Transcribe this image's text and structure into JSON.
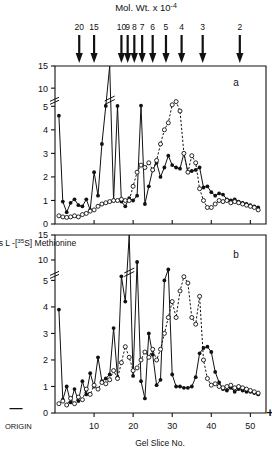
{
  "figure": {
    "top_title": "Mol. Wt. x 10-4",
    "x_axis_label": "Gel Slice No.",
    "y_axis_label": "% Total counts  L -[35S] Methionine",
    "origin_label": "ORIGIN",
    "negative_sign": "—",
    "positive_sign": "+",
    "panel_a_label": "a",
    "panel_b_label": "b"
  },
  "chart_data": [
    {
      "type": "line",
      "panel": "a",
      "title": "Mol. Wt. x 10-4",
      "xlabel": "Gel Slice No.",
      "ylabel": "% Total counts  L -[35S] Methionine",
      "xlim": [
        0,
        54
      ],
      "ylim": [
        0,
        15
      ],
      "y_axis_break": [
        5,
        10
      ],
      "xticks": [
        10,
        20,
        30,
        40,
        50
      ],
      "yticks": [
        0,
        1,
        2,
        3,
        4,
        5,
        10,
        15
      ],
      "grid": false,
      "legend": "none",
      "marker_axis": {
        "name": "Mol. Wt. x 10-4",
        "labels": [
          "20",
          "15",
          "10",
          "9",
          "8",
          "7",
          "6",
          "5",
          "4",
          "3",
          "2"
        ],
        "slice_positions": [
          6.2,
          10.0,
          17.0,
          18.6,
          20.3,
          22.3,
          25.0,
          28.4,
          32.4,
          37.8,
          47.3
        ]
      },
      "series": [
        {
          "name": "solid-filled-circles",
          "marker": "filled-circle",
          "line": "solid",
          "x": [
            1,
            2,
            3,
            4,
            5,
            6,
            7,
            8,
            9,
            10,
            11,
            12,
            13,
            14,
            15,
            16,
            17,
            18,
            19,
            20,
            21,
            22,
            23,
            24,
            25,
            26,
            27,
            28,
            29,
            30,
            31,
            32,
            33,
            34,
            35,
            36,
            37,
            38,
            39,
            40,
            41,
            42,
            43,
            44,
            45,
            46,
            47,
            48,
            49,
            50,
            51,
            52
          ],
          "y": [
            4.6,
            0.95,
            0.5,
            0.9,
            1.05,
            0.8,
            0.75,
            1.05,
            0.6,
            2.2,
            1.2,
            3.4,
            5.1,
            15.0,
            1.0,
            5.1,
            0.95,
            0.75,
            1.1,
            1.0,
            1.2,
            5.2,
            0.85,
            1.6,
            2.3,
            2.6,
            2.0,
            2.4,
            2.9,
            2.5,
            2.4,
            2.35,
            3.0,
            2.2,
            2.25,
            2.3,
            2.4,
            1.55,
            1.6,
            1.35,
            1.2,
            1.3,
            1.25,
            1.05,
            1.0,
            1.05,
            0.95,
            0.9,
            0.85,
            0.8,
            0.75,
            0.7
          ]
        },
        {
          "name": "dashed-open-circles",
          "marker": "open-circle",
          "line": "dashed",
          "x": [
            1,
            2,
            3,
            4,
            5,
            6,
            7,
            8,
            9,
            10,
            11,
            12,
            13,
            14,
            15,
            16,
            17,
            18,
            19,
            20,
            21,
            22,
            23,
            24,
            25,
            26,
            27,
            28,
            29,
            30,
            31,
            32,
            33,
            34,
            35,
            36,
            37,
            38,
            39,
            40,
            41,
            42,
            43,
            44,
            45,
            46,
            47,
            48,
            49,
            50,
            51,
            52
          ],
          "y": [
            0.35,
            0.3,
            0.28,
            0.3,
            0.35,
            0.3,
            0.4,
            0.45,
            0.55,
            0.6,
            0.75,
            0.85,
            0.9,
            0.95,
            1.0,
            1.0,
            1.05,
            1.0,
            1.0,
            1.6,
            2.2,
            2.5,
            2.4,
            2.6,
            2.3,
            2.7,
            3.4,
            4.0,
            4.3,
            5.4,
            6.3,
            4.8,
            3.0,
            2.2,
            2.9,
            2.6,
            1.5,
            1.0,
            0.7,
            0.7,
            0.85,
            1.0,
            0.95,
            1.0,
            0.9,
            0.95,
            0.9,
            0.85,
            0.8,
            0.75,
            0.7,
            0.6
          ]
        }
      ]
    },
    {
      "type": "line",
      "panel": "b",
      "xlabel": "Gel Slice No.",
      "ylabel": "% Total counts  L -[35S] Methionine",
      "xlim": [
        0,
        54
      ],
      "ylim": [
        0,
        15
      ],
      "y_axis_break": [
        5,
        10
      ],
      "xticks": [
        10,
        20,
        30,
        40,
        50
      ],
      "yticks": [
        0,
        1,
        2,
        3,
        4,
        5,
        10,
        15
      ],
      "grid": false,
      "legend": "none",
      "series": [
        {
          "name": "solid-filled-circles",
          "marker": "filled-circle",
          "line": "solid",
          "x": [
            1,
            2,
            3,
            4,
            5,
            6,
            7,
            8,
            9,
            10,
            11,
            12,
            13,
            14,
            15,
            16,
            17,
            18,
            19,
            20,
            21,
            22,
            23,
            24,
            25,
            26,
            27,
            28,
            29,
            30,
            31,
            32,
            33,
            34,
            35,
            36,
            37,
            38,
            39,
            40,
            41,
            42,
            43,
            44,
            45,
            46,
            47,
            48,
            49,
            50,
            51,
            52
          ],
          "y": [
            3.9,
            0.5,
            1.0,
            0.4,
            0.9,
            0.45,
            1.2,
            0.7,
            1.5,
            1.0,
            2.1,
            1.2,
            1.3,
            1.45,
            3.2,
            1.35,
            6.0,
            4.2,
            15.0,
            1.4,
            9.5,
            1.2,
            0.55,
            3.0,
            2.2,
            1.05,
            1.25,
            5.0,
            11.2,
            1.45,
            1.0,
            1.0,
            0.95,
            0.95,
            1.0,
            1.35,
            2.25,
            2.45,
            2.5,
            2.3,
            1.55,
            1.15,
            0.9,
            0.85,
            0.95,
            0.8,
            0.9,
            0.85,
            0.8,
            0.8,
            0.75,
            0.7
          ]
        },
        {
          "name": "dashed-open-circles",
          "marker": "open-circle",
          "line": "dashed",
          "x": [
            1,
            2,
            3,
            4,
            5,
            6,
            7,
            8,
            9,
            10,
            11,
            12,
            13,
            14,
            15,
            16,
            17,
            18,
            19,
            20,
            21,
            22,
            23,
            24,
            25,
            26,
            27,
            28,
            29,
            30,
            31,
            32,
            33,
            34,
            35,
            36,
            37,
            38,
            39,
            40,
            41,
            42,
            43,
            44,
            45,
            46,
            47,
            48,
            49,
            50,
            51,
            52
          ],
          "y": [
            0.35,
            0.45,
            0.3,
            0.55,
            0.35,
            0.6,
            0.5,
            0.9,
            0.7,
            1.05,
            0.9,
            1.15,
            1.1,
            1.25,
            1.6,
            1.3,
            1.9,
            2.5,
            2.1,
            1.6,
            1.7,
            2.0,
            2.3,
            2.1,
            2.4,
            2.0,
            2.4,
            3.0,
            3.6,
            4.2,
            3.6,
            4.6,
            5.9,
            4.9,
            3.6,
            3.35,
            4.4,
            2.0,
            1.3,
            1.05,
            1.1,
            1.0,
            0.95,
            1.0,
            1.05,
            0.95,
            1.0,
            0.95,
            0.9,
            0.85,
            0.8,
            0.75
          ]
        }
      ]
    }
  ]
}
